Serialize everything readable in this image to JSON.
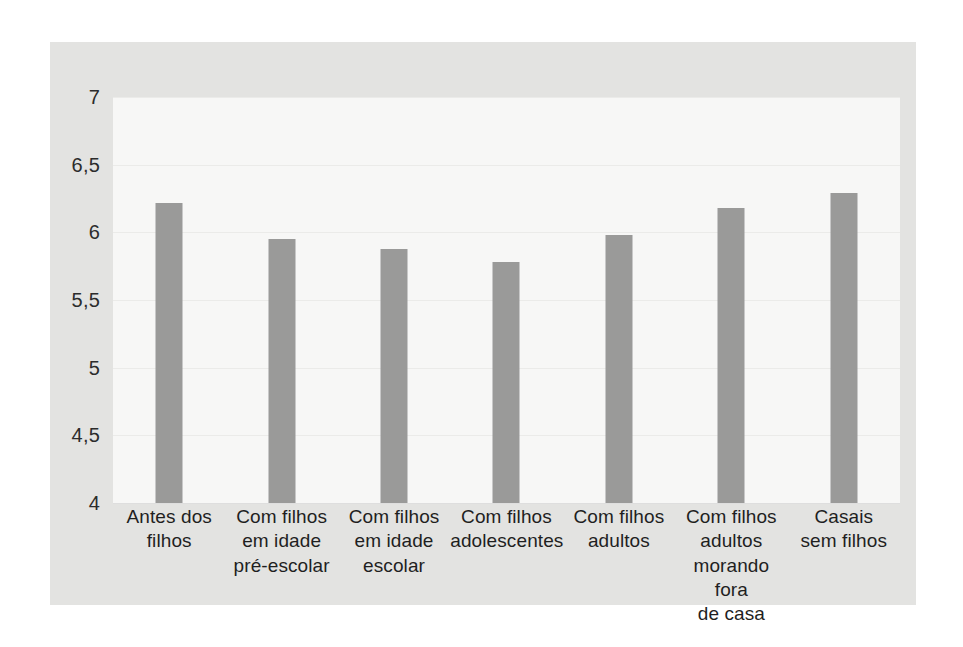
{
  "chart_data": {
    "type": "bar",
    "title": "",
    "subtitle": "",
    "xlabel": "",
    "ylabel": "",
    "ylim": [
      4,
      7
    ],
    "ytick_values": [
      4,
      4.5,
      5,
      5.5,
      6,
      6.5,
      7
    ],
    "ytick_labels": [
      "4",
      "4,5",
      "5",
      "5,5",
      "6",
      "6,5",
      "7"
    ],
    "decimal_separator": ",",
    "grid": true,
    "legend": "none",
    "categories": [
      "Antes dos\nfilhos",
      "Com filhos\nem idade\npré-escolar",
      "Com filhos\nem idade\nescolar",
      "Com filhos\nadolescentes",
      "Com filhos\nadultos",
      "Com filhos\nadultos\nmorando fora\nde casa",
      "Casais\nsem filhos"
    ],
    "values": [
      6.22,
      5.95,
      5.88,
      5.78,
      5.98,
      6.18,
      6.29
    ],
    "series": [
      {
        "name": "",
        "values": [
          6.22,
          5.95,
          5.88,
          5.78,
          5.98,
          6.18,
          6.29
        ]
      }
    ],
    "bar_color": "#9a9a99",
    "plot_background": "#f7f7f6",
    "panel_background": "#e3e3e1",
    "page_background": "#ffffff"
  }
}
